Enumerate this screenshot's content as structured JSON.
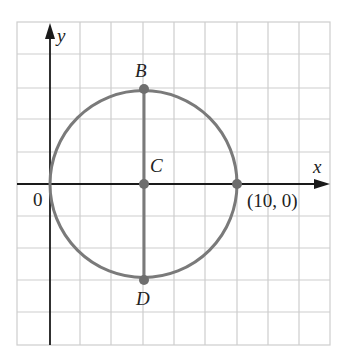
{
  "figure": {
    "type": "coordinate-plane-circle",
    "axes": {
      "x_label": "x",
      "y_label": "y",
      "origin_label": "0"
    },
    "points": [
      {
        "name": "B",
        "label": "B"
      },
      {
        "name": "C",
        "label": "C"
      },
      {
        "name": "D",
        "label": "D"
      },
      {
        "name": "P",
        "label": "(10, 0)"
      }
    ],
    "circle": {
      "center": [
        5,
        0
      ],
      "radius": 5,
      "passes_through": [
        "(0, 0)",
        "(10, 0)"
      ]
    },
    "segment": {
      "from": "B",
      "to": "D",
      "through": "C"
    }
  },
  "colors": {
    "grid": "#c8c8c8",
    "axis": "#1a1a1a",
    "circle": "#7a7a7a",
    "point": "#6e6e6e"
  }
}
